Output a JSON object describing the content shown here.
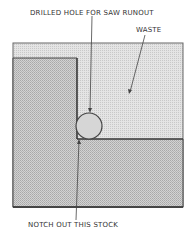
{
  "diagram": {
    "labels": {
      "drilled_hole": "DRILLED HOLE FOR SAW RUNOUT",
      "waste": "WASTE",
      "notch": "NOTCH OUT THIS STOCK"
    },
    "colors": {
      "waste_fill": "#d9d9d9",
      "stock_fill": "#c4c4c4",
      "outline": "#555555",
      "text": "#333333"
    }
  }
}
